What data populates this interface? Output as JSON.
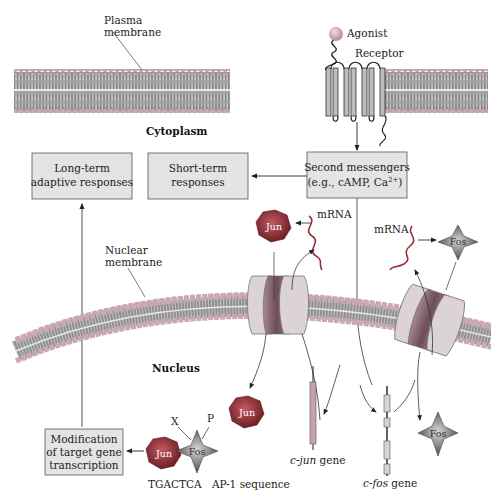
{
  "labels": {
    "plasma_membrane_line1": "Plasma",
    "plasma_membrane_line2": "membrane",
    "agonist": "Agonist",
    "receptor": "Receptor",
    "cytoplasm": "Cytoplasm",
    "nuclear_membrane_line1": "Nuclear",
    "nuclear_membrane_line2": "membrane",
    "nucleus": "Nucleus",
    "mrna_jun": "mRNA",
    "mrna_fos": "mRNA",
    "c_jun_prefix": "c-jun",
    "c_jun_suffix": " gene",
    "c_fos_prefix": "c-fos",
    "c_fos_suffix": " gene",
    "tgactca": "TGACTCA",
    "ap1": "AP-1 sequence",
    "x_mark": "X",
    "p_mark": "P"
  },
  "boxes": {
    "long_term": {
      "line1": "Long-term",
      "line2": "adaptive responses"
    },
    "short_term": {
      "line1": "Short-term",
      "line2": "responses"
    },
    "second_messengers": {
      "line1": "Second messengers",
      "line2": "(e.g., cAMP, Ca",
      "sup": "2+",
      "close": ")"
    },
    "modification": {
      "line1": "Modification",
      "line2": "of target gene",
      "line3": "transcription"
    }
  },
  "proteins": {
    "jun_top": "Jun",
    "jun_mid": "Jun",
    "jun_complex": "Jun",
    "fos_top": "Fos",
    "fos_bottom": "Fos",
    "fos_complex": "Fos"
  },
  "colors": {
    "membrane_head": "#c9a9b3",
    "membrane_tail": "#8f8f8f",
    "membrane_core": "#c8c8c8",
    "box_fill": "#e4e4e4",
    "jun_fill": "#8b2a32",
    "fos_fill": "#6e6e6e",
    "mrna": "#9a2f3a",
    "pore": "#dcd3d5",
    "pore_dark": "#8a6a70"
  }
}
